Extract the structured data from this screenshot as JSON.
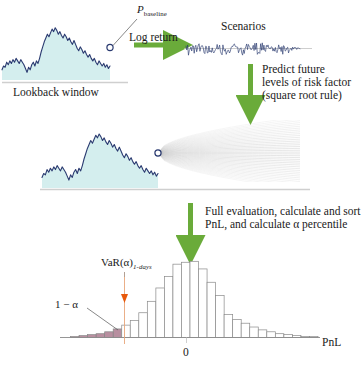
{
  "figure": {
    "background": "#ffffff",
    "width": 364,
    "height": 373
  },
  "colors": {
    "price_line": "#2a3a70",
    "price_fill": "#d4eeee",
    "arrow_green": "#6aab3a",
    "fan_grey": "#b9b9b9",
    "tail_fill": "#a06a80",
    "var_marker": "#e8590c",
    "text": "#1a1a1a",
    "axis": "#6b6b6b",
    "hist_stroke": "#8a8a8a"
  },
  "labels": {
    "p_baseline": "P",
    "p_baseline_sub": "baseline",
    "lookback_window": "Lookback window",
    "log_return": "Log return",
    "scenarios": "Scenarios",
    "predict_line1": "Predict future",
    "predict_line2": "levels of risk factor",
    "predict_line3": "(square root rule)",
    "full_eval_line1": "Full evaluation, calculate and sort",
    "full_eval_line2": "PnL, and calculate α percentile",
    "var_label": "VaR(α)",
    "var_label_sub": "1-days",
    "one_minus_alpha": "1 − α",
    "pnl_axis": "PnL",
    "zero_tick": "0"
  },
  "chart_data": {
    "type": "diagram",
    "panels": [
      {
        "name": "lookback-window-chart",
        "type": "area",
        "ylabel": "",
        "xlabel": "Lookback window",
        "annotation": "P_baseline",
        "series_name": "risk factor level",
        "values": [
          38,
          41,
          40,
          44,
          42,
          45,
          43,
          46,
          44,
          47,
          45,
          43,
          46,
          44,
          42,
          39,
          36,
          40,
          38,
          42,
          44,
          41,
          45,
          43,
          47,
          52,
          56,
          60,
          63,
          66,
          64,
          67,
          70,
          68,
          71,
          69,
          66,
          68,
          65,
          63,
          66,
          64,
          61,
          63,
          60,
          58,
          61,
          58,
          55,
          53,
          56,
          54,
          51,
          53,
          50,
          48,
          50,
          47,
          45,
          47,
          44,
          42,
          45,
          43,
          41,
          43,
          40,
          42,
          39,
          41
        ]
      },
      {
        "name": "scenarios-log-return-series",
        "type": "line",
        "title": "Scenarios",
        "ylabel": "",
        "xlabel": "",
        "description": "noisy zero-mean log return time series",
        "n_points": 140
      },
      {
        "name": "predicted-levels-fan-chart",
        "type": "area",
        "description": "historical path with square-root-of-time scenario fan",
        "fan_rays": 40,
        "values": [
          38,
          41,
          40,
          44,
          42,
          45,
          43,
          46,
          44,
          47,
          45,
          43,
          46,
          44,
          42,
          39,
          36,
          40,
          38,
          42,
          44,
          41,
          45,
          43,
          47,
          52,
          56,
          60,
          63,
          66,
          64,
          67,
          70,
          68,
          71,
          69,
          66,
          68,
          65,
          63,
          66,
          64,
          61,
          63,
          60,
          58,
          61,
          58,
          55,
          53,
          56,
          54,
          51,
          53,
          50,
          48,
          50,
          47,
          45,
          47,
          44,
          42,
          45,
          43,
          41,
          43,
          40,
          42,
          39,
          41
        ]
      },
      {
        "name": "pnl-distribution-histogram",
        "type": "bar",
        "title": "",
        "xlabel": "PnL",
        "ylabel": "",
        "xticks": [
          "0"
        ],
        "xtick_positions": [
          16
        ],
        "grid": false,
        "var_bin_index": 6,
        "tail_bins": [
          1,
          2,
          3,
          4,
          5,
          6
        ],
        "categories": [
          "b1",
          "b2",
          "b3",
          "b4",
          "b5",
          "b6",
          "b7",
          "b8",
          "b9",
          "b10",
          "b11",
          "b12",
          "b13",
          "b14",
          "b15",
          "b16",
          "b17",
          "b18",
          "b19",
          "b20",
          "b21",
          "b22",
          "b23",
          "b24",
          "b25",
          "b26",
          "b27",
          "b28",
          "b29",
          "b30"
        ],
        "values": [
          0,
          1,
          2,
          3,
          4,
          6,
          9,
          13,
          18,
          26,
          38,
          52,
          64,
          77,
          79,
          80,
          72,
          58,
          44,
          24,
          19,
          15,
          11,
          8,
          6,
          4,
          3,
          2,
          1,
          1
        ],
        "ylim": [
          0,
          84
        ]
      }
    ]
  }
}
